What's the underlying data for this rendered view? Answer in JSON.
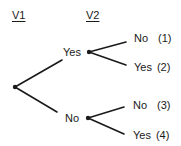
{
  "headers": {
    "v1": "V1",
    "v2": "V2"
  },
  "tree": {
    "root": {
      "x": 15,
      "y": 87
    },
    "level1": [
      {
        "label": "Yes",
        "node": {
          "x": 89,
          "y": 52
        }
      },
      {
        "label": "No",
        "node": {
          "x": 88,
          "y": 118
        }
      }
    ],
    "leaves": [
      {
        "label": "No",
        "index": "(1)"
      },
      {
        "label": "Yes",
        "index": "(2)"
      },
      {
        "label": "No",
        "index": "(3)"
      },
      {
        "label": "Yes",
        "index": "(4)"
      }
    ]
  },
  "colors": {
    "line": "#1a1a1a",
    "background": "#ffffff"
  }
}
